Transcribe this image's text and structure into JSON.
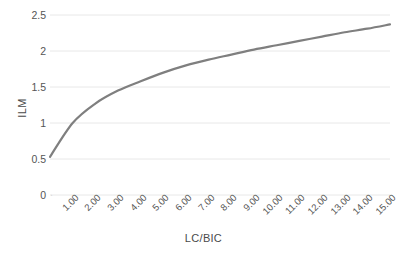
{
  "chart_data": {
    "type": "line",
    "title": "",
    "xlabel": "LC/BIC",
    "ylabel": "ILM",
    "x": [
      0.5,
      1.0,
      2.0,
      3.0,
      4.0,
      5.0,
      6.0,
      7.0,
      8.0,
      9.0,
      10.0,
      11.0,
      12.0,
      13.0,
      14.0,
      15.0
    ],
    "categories": [
      "",
      "1.00",
      "2.00",
      "3.00",
      "4.00",
      "5.00",
      "6.00",
      "7.00",
      "8.00",
      "9.00",
      "10.00",
      "11.00",
      "12.00",
      "13.00",
      "14.00",
      "15.00"
    ],
    "values": [
      0.53,
      1.0,
      1.27,
      1.45,
      1.58,
      1.7,
      1.8,
      1.88,
      1.95,
      2.02,
      2.08,
      2.14,
      2.2,
      2.26,
      2.31,
      2.37
    ],
    "series": [
      {
        "name": "ILM",
        "values": [
          0.53,
          1.0,
          1.27,
          1.45,
          1.58,
          1.7,
          1.8,
          1.88,
          1.95,
          2.02,
          2.08,
          2.14,
          2.2,
          2.26,
          2.31,
          2.37
        ],
        "color": "#7f7f7f"
      }
    ],
    "ylim": [
      0,
      2.5
    ],
    "yticks": [
      0,
      0.5,
      1,
      1.5,
      2,
      2.5
    ],
    "ytick_labels": [
      "0",
      "0.5",
      "1",
      "1.5",
      "2",
      "2.5"
    ],
    "xtick_labels": [
      "",
      "1.00",
      "2.00",
      "3.00",
      "4.00",
      "5.00",
      "6.00",
      "7.00",
      "8.00",
      "9.00",
      "10.00",
      "11.00",
      "12.00",
      "13.00",
      "14.00",
      "15.00"
    ],
    "grid": true,
    "grid_axis": "y",
    "grid_color": "#e8e8e8",
    "legend": false,
    "legend_position": "none",
    "line_color": "#7f7f7f",
    "line_width": 2.2,
    "background": "#ffffff",
    "xtick_rotation": -45
  },
  "axis": {
    "y_title": "ILM",
    "x_title": "LC/BIC"
  }
}
